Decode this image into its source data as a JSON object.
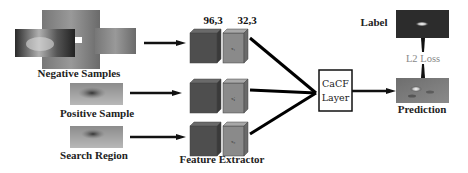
{
  "diagram": {
    "inputs": {
      "negative_samples": "Negative Samples",
      "positive_sample": "Positive Sample",
      "search_region": "Search Region"
    },
    "feature_extractor": {
      "label": "Feature Extractor",
      "dim_a": "96,3",
      "dim_b": "32,3",
      "cube_labels": [
        "x₁",
        "xᵢⱼ",
        "x₀"
      ]
    },
    "cacf_layer": {
      "line1": "CaCF",
      "line2": "Layer"
    },
    "outputs": {
      "label": "Label",
      "loss": "L2 Loss",
      "prediction": "Prediction"
    }
  }
}
